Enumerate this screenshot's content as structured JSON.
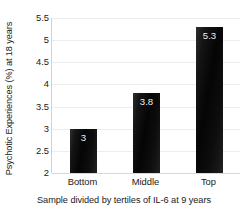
{
  "chart_data": {
    "type": "bar",
    "title": "",
    "categories": [
      "Bottom",
      "Middle",
      "Top"
    ],
    "values": [
      3,
      3.8,
      5.3
    ],
    "value_labels": [
      "3",
      "3.8",
      "5.3"
    ],
    "xlabel": "Sample divided by tertiles of IL-6 at 9 years",
    "ylabel": "Psychotic Experiences (%) at 18 years",
    "ylim": [
      2,
      5.5
    ],
    "ytick_labels": [
      "5.5",
      "5",
      "4.5",
      "4",
      "3.5",
      "3",
      "2.5",
      "2"
    ],
    "ytick_values": [
      5.5,
      5,
      4.5,
      4,
      3.5,
      3,
      2.5,
      2
    ],
    "grid": true,
    "legend": false,
    "colors": {
      "bar": "#0a0a0a",
      "bar_label": "#f2f2f2",
      "gridline": "#ededed",
      "axis": "#d2d2d2",
      "background": "#ffffff",
      "text": "#1a1a1a"
    }
  }
}
